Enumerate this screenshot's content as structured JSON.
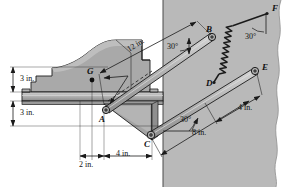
{
  "figure": {
    "domain": "engineering-mechanics-free-body-diagram",
    "background_color": "#ffffff",
    "wall_color": "#b9b9b9",
    "body_fill": "#a9a9a9",
    "body_fill_light": "#c4c4c4",
    "body_fill_dark": "#8e8e8e",
    "line_color": "#1a1a1a"
  },
  "points": [
    {
      "id": "A",
      "label": "A",
      "x": 104,
      "y": 112,
      "kind": "pin-joint"
    },
    {
      "id": "B",
      "label": "B",
      "x": 212,
      "y": 37,
      "kind": "pin-joint"
    },
    {
      "id": "C",
      "label": "C",
      "x": 150,
      "y": 137,
      "kind": "pin-joint"
    },
    {
      "id": "D",
      "label": "D",
      "x": 214,
      "y": 83,
      "kind": "spring-anchor"
    },
    {
      "id": "E",
      "label": "E",
      "x": 257,
      "y": 72,
      "kind": "pin-joint"
    },
    {
      "id": "F",
      "label": "F",
      "x": 269,
      "y": 13,
      "kind": "spring-anchor"
    },
    {
      "id": "G",
      "label": "G",
      "x": 92,
      "y": 76,
      "kind": "center-of-gravity"
    }
  ],
  "dimensions": [
    {
      "id": "len-12",
      "text": "12 in.",
      "value": 12,
      "unit": "in.",
      "orientation": "along-link-AB"
    },
    {
      "id": "height-3a",
      "text": "3 in.",
      "value": 3,
      "unit": "in.",
      "orientation": "vertical"
    },
    {
      "id": "height-3b",
      "text": "3 in.",
      "value": 3,
      "unit": "in.",
      "orientation": "vertical"
    },
    {
      "id": "width-2",
      "text": "2 in.",
      "value": 2,
      "unit": "in.",
      "orientation": "horizontal"
    },
    {
      "id": "width-4",
      "text": "4 in.",
      "value": 4,
      "unit": "in.",
      "orientation": "horizontal"
    },
    {
      "id": "len-4",
      "text": "4 in.",
      "value": 4,
      "unit": "in.",
      "orientation": "along-link-DE"
    },
    {
      "id": "len-8",
      "text": "8 in.",
      "value": 8,
      "unit": "in.",
      "orientation": "along-link-CE"
    }
  ],
  "angles": [
    {
      "id": "angle-B",
      "text": "30°",
      "value": 30,
      "unit": "deg",
      "at": "link-AB-to-vertical"
    },
    {
      "id": "angle-F",
      "text": "30°",
      "value": 30,
      "unit": "deg",
      "at": "spring-DF-to-vertical"
    },
    {
      "id": "angle-C",
      "text": "30°",
      "value": 30,
      "unit": "deg",
      "at": "link-CE-to-horizontal"
    }
  ]
}
